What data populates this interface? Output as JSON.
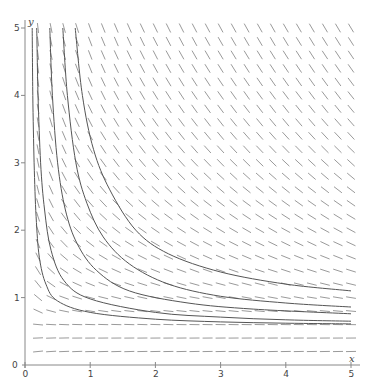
{
  "chart_data": {
    "type": "line",
    "subtype": "slope-field",
    "title": "",
    "xlabel": "x",
    "ylabel": "y",
    "xlim": [
      0,
      5
    ],
    "ylim": [
      0,
      5
    ],
    "x_ticks": [
      "0",
      "1",
      "2",
      "3",
      "4",
      "5"
    ],
    "y_ticks": [
      "0",
      "1",
      "2",
      "3",
      "4",
      "5"
    ],
    "grid": false,
    "legend": null,
    "slope_field": {
      "x_start": 0.2,
      "x_end": 5.0,
      "y_start": 0.2,
      "y_end": 5.0,
      "step": 0.2,
      "segment_length_px": 10,
      "equilibrium_y": 0.55,
      "description": "direction segments; horizontal near y<=0.6, increasingly steep negative slopes for larger y and smaller x"
    },
    "series": [
      {
        "name": "solution-1",
        "points": [
          [
            0.11,
            5.0
          ],
          [
            0.12,
            4.0
          ],
          [
            0.14,
            3.0
          ],
          [
            0.17,
            2.2
          ],
          [
            0.22,
            1.6
          ],
          [
            0.32,
            1.2
          ],
          [
            0.5,
            0.95
          ],
          [
            1.0,
            0.78
          ],
          [
            2.0,
            0.68
          ],
          [
            3.0,
            0.64
          ],
          [
            4.0,
            0.62
          ],
          [
            5.0,
            0.61
          ]
        ]
      },
      {
        "name": "solution-2",
        "points": [
          [
            0.18,
            5.0
          ],
          [
            0.2,
            4.0
          ],
          [
            0.24,
            3.0
          ],
          [
            0.3,
            2.3
          ],
          [
            0.4,
            1.7
          ],
          [
            0.6,
            1.25
          ],
          [
            1.0,
            0.98
          ],
          [
            2.0,
            0.78
          ],
          [
            3.0,
            0.71
          ],
          [
            4.0,
            0.67
          ],
          [
            5.0,
            0.65
          ]
        ]
      },
      {
        "name": "solution-3",
        "points": [
          [
            0.38,
            5.0
          ],
          [
            0.42,
            4.0
          ],
          [
            0.5,
            3.0
          ],
          [
            0.62,
            2.3
          ],
          [
            0.8,
            1.8
          ],
          [
            1.1,
            1.4
          ],
          [
            1.6,
            1.1
          ],
          [
            2.5,
            0.92
          ],
          [
            3.5,
            0.83
          ],
          [
            5.0,
            0.76
          ]
        ]
      },
      {
        "name": "solution-4",
        "points": [
          [
            0.58,
            5.0
          ],
          [
            0.65,
            4.0
          ],
          [
            0.78,
            3.0
          ],
          [
            0.95,
            2.4
          ],
          [
            1.2,
            1.9
          ],
          [
            1.6,
            1.5
          ],
          [
            2.2,
            1.2
          ],
          [
            3.0,
            1.02
          ],
          [
            4.0,
            0.92
          ],
          [
            5.0,
            0.86
          ]
        ]
      },
      {
        "name": "solution-5",
        "points": [
          [
            0.77,
            5.0
          ],
          [
            0.88,
            4.0
          ],
          [
            1.05,
            3.2
          ],
          [
            1.3,
            2.6
          ],
          [
            1.7,
            2.0
          ],
          [
            2.2,
            1.65
          ],
          [
            3.0,
            1.38
          ],
          [
            4.0,
            1.2
          ],
          [
            5.0,
            1.1
          ]
        ]
      }
    ]
  },
  "axes": {
    "x_name": "x",
    "y_name": "y",
    "x_tick_labels": [
      "0",
      "1",
      "2",
      "3",
      "4",
      "5"
    ],
    "y_tick_labels": [
      "0",
      "1",
      "2",
      "3",
      "4",
      "5"
    ]
  },
  "caption": {
    "text": ""
  },
  "colors": {
    "axis": "#888888",
    "segments": "#9a9a9a",
    "curves": "#555555",
    "labels": "#444444"
  }
}
